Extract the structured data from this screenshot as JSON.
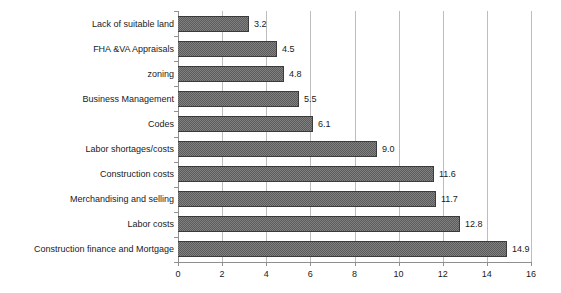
{
  "chart_data": {
    "type": "bar",
    "orientation": "horizontal",
    "title": "",
    "subtitle": "",
    "xlabel": "",
    "ylabel": "",
    "xlim": [
      0,
      16
    ],
    "xticks": [
      0,
      2,
      4,
      6,
      8,
      10,
      12,
      14,
      16
    ],
    "xtick_labels": [
      "0",
      "2",
      "4",
      "6",
      "8",
      "10",
      "12",
      "14",
      "16"
    ],
    "grid": true,
    "grid_axis": "x",
    "legend": false,
    "legend_position": "none",
    "categories": [
      "Lack of suitable land",
      "FHA &VA Appraisals",
      "zoning",
      "Business Management",
      "Codes",
      "Labor shortages/costs",
      "Construction costs",
      "Merchandising and selling",
      "Labor costs",
      "Construction finance and Mortgage"
    ],
    "values": [
      3.2,
      4.5,
      4.8,
      5.5,
      6.1,
      9.0,
      11.6,
      11.7,
      12.8,
      14.9
    ],
    "data_labels": [
      "3.2",
      "4.5",
      "4.8",
      "5.5",
      "6.1",
      "9.0",
      "11.6",
      "11.7",
      "12.8",
      "14.9"
    ],
    "bar_color": "#5b5b5b",
    "bar_edge_color": "#3b3b3b",
    "grid_color": "#bdbdbd",
    "axis_color": "#8f8f8f",
    "background_color": "#ffffff",
    "text_color": "#1a1a1a"
  }
}
